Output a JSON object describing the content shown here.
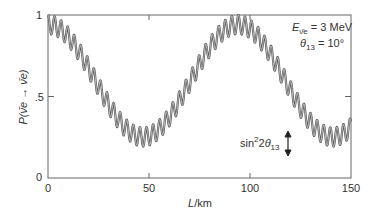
{
  "chart_data": {
    "type": "line",
    "title": "",
    "xlabel": "L/km",
    "ylabel": "P(ν̄e → ν̄e)",
    "xlim": [
      0,
      150
    ],
    "ylim": [
      0,
      1
    ],
    "grid": false,
    "legend": null,
    "x_ticks": [
      0,
      50,
      100,
      150
    ],
    "x_tick_labels": [
      "0",
      "50",
      "100",
      "150"
    ],
    "y_ticks": [
      0,
      0.5,
      1
    ],
    "y_tick_labels": [
      "0",
      ".5",
      "1"
    ],
    "annotations": [
      {
        "text": "E_ν̄e = 3 MeV",
        "position": "top-right"
      },
      {
        "text": "θ13 = 10°",
        "position": "top-right"
      },
      {
        "text": "sin²2θ13",
        "position": "lower-right",
        "arrow": "double-headed vertical indicating fast-oscillation amplitude"
      }
    ],
    "model": {
      "description": "P = 1 - A_slow*sin^2(pi*L/slow_period) - A_fast*sin^2(pi*L/fast_period)",
      "A_slow": 0.69,
      "slow_period_km": 94,
      "A_fast": 0.117,
      "fast_period_km": 3.25
    },
    "series": [
      {
        "name": "P(ν̄e → ν̄e)",
        "x": [
          0,
          10,
          20,
          30,
          40,
          47,
          60,
          70,
          80,
          94,
          110,
          120,
          130,
          141,
          150
        ],
        "values": [
          0.94,
          0.87,
          0.65,
          0.43,
          0.29,
          0.25,
          0.34,
          0.52,
          0.76,
          0.94,
          0.74,
          0.49,
          0.32,
          0.25,
          0.3
        ]
      }
    ]
  },
  "labels": {
    "y0": "0",
    "y05": ".5",
    "y1": "1",
    "x0": "0",
    "x50": "50",
    "x100": "100",
    "x150": "150",
    "xlabel_L": "L",
    "xlabel_unit": "/km",
    "ylabel": "P(ν̄e → ν̄e)",
    "energy_E": "E",
    "energy_sub": "ν̄e",
    "energy_val": " = 3 MeV",
    "theta_sym": "θ",
    "theta_sub": "13",
    "theta_val": " = 10°",
    "amp_sin": "sin",
    "amp_sup": "2",
    "amp_two": "2",
    "amp_theta": "θ",
    "amp_sub": "13"
  }
}
